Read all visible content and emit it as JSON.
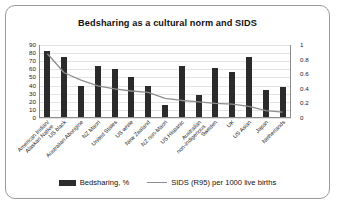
{
  "chart_data": {
    "type": "bar",
    "title": "Bedsharing as a cultural norm and SIDS",
    "xlabel": "",
    "ylabel": "",
    "grid": true,
    "legend_position": "bottom",
    "categories": [
      "American Indian/\nAlaskan Native",
      "US black",
      "Australian Aborigine",
      "NZ Maori",
      "United States",
      "US white",
      "New Zealand",
      "NZ non-Maori",
      "US Hispanic",
      "Australian\nnon-indigenous",
      "Sweden",
      "UK",
      "US Asian",
      "Japan",
      "Netherlands"
    ],
    "series": [
      {
        "name": "Bedsharing, %",
        "type": "bar",
        "axis": "left",
        "color": "#2b2b2b",
        "values": [
          83,
          75,
          39,
          64,
          60,
          51,
          39,
          16,
          64,
          28,
          62,
          57,
          75,
          34,
          38
        ]
      },
      {
        "name": "SIDS (R95) per 1000 live births",
        "type": "line",
        "axis": "right",
        "color": "#8e8e8e",
        "values": [
          0.88,
          0.62,
          0.52,
          0.44,
          0.4,
          0.37,
          0.35,
          0.27,
          0.24,
          0.22,
          0.2,
          0.19,
          0.16,
          0.1,
          0.08
        ]
      }
    ],
    "y_left": {
      "min": 0,
      "max": 90,
      "ticks": [
        0,
        10,
        20,
        30,
        40,
        50,
        60,
        70,
        80,
        90
      ],
      "tick_labels": [
        "0",
        "10",
        "20",
        "30",
        "40",
        "50",
        "60",
        "70",
        "80",
        "90"
      ]
    },
    "y_right": {
      "min": 0,
      "max": 1,
      "ticks": [
        0,
        0.2,
        0.4,
        0.6,
        0.8,
        1
      ],
      "tick_labels": [
        "0",
        "0.2",
        "0.4",
        "0.6",
        "0.8",
        "1"
      ]
    },
    "legend": [
      {
        "label": "Bedsharing, %",
        "marker": "bar",
        "color": "#2b2b2b"
      },
      {
        "label": "SIDS (R95) per 1000 live births",
        "marker": "line",
        "color": "#8e8e8e"
      }
    ]
  }
}
